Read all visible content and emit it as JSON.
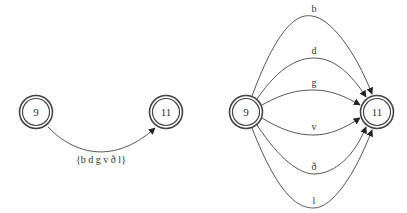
{
  "left_graph": {
    "nodes": [
      {
        "id": "n9",
        "label": "9"
      },
      {
        "id": "n11",
        "label": "11"
      }
    ],
    "edge": {
      "from": "9",
      "to": "11",
      "label": "{b d g v ð l}"
    }
  },
  "right_graph": {
    "nodes": [
      {
        "id": "n9",
        "label": "9"
      },
      {
        "id": "n11",
        "label": "11"
      }
    ],
    "edges": [
      {
        "from": "9",
        "to": "11",
        "label": "b"
      },
      {
        "from": "9",
        "to": "11",
        "label": "d"
      },
      {
        "from": "9",
        "to": "11",
        "label": "g"
      },
      {
        "from": "9",
        "to": "11",
        "label": "v"
      },
      {
        "from": "9",
        "to": "11",
        "label": "ð"
      },
      {
        "from": "9",
        "to": "11",
        "label": "l"
      }
    ]
  },
  "colors": {
    "stroke": "#444444",
    "background": "#ffffff"
  }
}
